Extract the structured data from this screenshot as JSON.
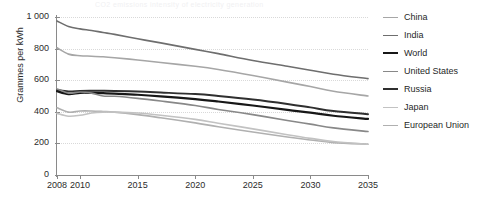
{
  "title_faint": "CO2 emissions intensity of electricity generation",
  "axes": {
    "ylabel": "Grammes per kWh",
    "yticks": [
      0,
      200,
      400,
      600,
      800,
      1000
    ],
    "ytick_labels": [
      "0",
      "200",
      "400",
      "600",
      "800",
      "1 000"
    ],
    "xticks": [
      2008,
      2010,
      2015,
      2020,
      2025,
      2030,
      2035
    ],
    "xtick_labels": [
      "2008",
      "2010",
      "2015",
      "2020",
      "2025",
      "2030",
      "2035"
    ]
  },
  "legend": {
    "position": "right",
    "items": [
      {
        "label": "China",
        "color": "#a6a6a6",
        "width": 1.6
      },
      {
        "label": "India",
        "color": "#6e6e6e",
        "width": 1.6
      },
      {
        "label": "World",
        "color": "#171717",
        "width": 2.2
      },
      {
        "label": "United States",
        "color": "#888888",
        "width": 1.6
      },
      {
        "label": "Russia",
        "color": "#2f2f2f",
        "width": 2.0
      },
      {
        "label": "Japan",
        "color": "#c2c2c2",
        "width": 1.6
      },
      {
        "label": "European Union",
        "color": "#b0b0b0",
        "width": 1.6
      }
    ]
  },
  "chart_data": {
    "type": "line",
    "title": "CO2 emissions intensity of electricity generation",
    "xlabel": "",
    "ylabel": "Grammes per kWh",
    "xlim": [
      2008,
      2035
    ],
    "ylim": [
      0,
      1000
    ],
    "grid": true,
    "legend_position": "right",
    "x": [
      2008,
      2009,
      2010,
      2011,
      2012,
      2013,
      2015,
      2017,
      2020,
      2022,
      2025,
      2028,
      2030,
      2032,
      2035
    ],
    "series": [
      {
        "name": "India",
        "color": "#6e6e6e",
        "values": [
          975,
          940,
          925,
          915,
          902,
          890,
          862,
          836,
          795,
          768,
          725,
          688,
          663,
          638,
          610
        ]
      },
      {
        "name": "China",
        "color": "#a6a6a6",
        "values": [
          805,
          765,
          755,
          752,
          748,
          742,
          728,
          712,
          688,
          668,
          630,
          588,
          560,
          530,
          500
        ]
      },
      {
        "name": "Russia",
        "color": "#2f2f2f",
        "values": [
          538,
          528,
          532,
          533,
          533,
          532,
          528,
          522,
          512,
          500,
          478,
          450,
          428,
          405,
          385
        ]
      },
      {
        "name": "World",
        "color": "#171717",
        "values": [
          530,
          512,
          520,
          520,
          518,
          515,
          508,
          498,
          480,
          465,
          440,
          412,
          395,
          375,
          355
        ]
      },
      {
        "name": "United States",
        "color": "#888888",
        "values": [
          545,
          518,
          525,
          518,
          500,
          498,
          485,
          468,
          440,
          415,
          382,
          345,
          322,
          298,
          275
        ]
      },
      {
        "name": "European Union",
        "color": "#b0b0b0",
        "values": [
          425,
          398,
          405,
          405,
          402,
          398,
          382,
          362,
          330,
          305,
          272,
          240,
          222,
          205,
          195
        ]
      },
      {
        "name": "Japan",
        "color": "#c2c2c2",
        "values": [
          390,
          372,
          378,
          392,
          398,
          398,
          392,
          378,
          352,
          328,
          292,
          255,
          232,
          212,
          195
        ]
      }
    ]
  }
}
